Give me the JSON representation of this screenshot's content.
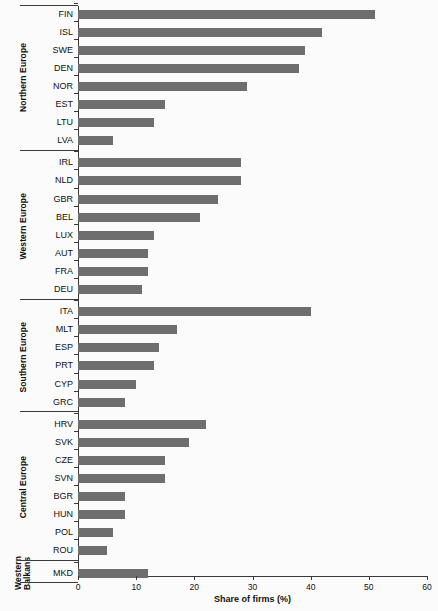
{
  "chart_data": {
    "type": "bar",
    "orientation": "horizontal",
    "title": "",
    "xlabel": "Share of firms (%)",
    "ylabel": "",
    "xlim": [
      0,
      60
    ],
    "xticks": [
      0,
      10,
      20,
      30,
      40,
      50,
      60
    ],
    "grid": false,
    "legend": null,
    "bar_color": "#6e6e6e",
    "categories": [
      "FIN",
      "ISL",
      "SWE",
      "DEN",
      "NOR",
      "EST",
      "LTU",
      "LVA",
      "IRL",
      "NLD",
      "GBR",
      "BEL",
      "LUX",
      "AUT",
      "FRA",
      "DEU",
      "ITA",
      "MLT",
      "ESP",
      "PRT",
      "CYP",
      "GRC",
      "HRV",
      "SVK",
      "CZE",
      "SVN",
      "BGR",
      "HUN",
      "POL",
      "ROU",
      "MKD"
    ],
    "values": [
      51,
      42,
      39,
      38,
      29,
      15,
      13,
      6,
      28,
      28,
      24,
      21,
      13,
      12,
      12,
      11,
      40,
      17,
      14,
      13,
      10,
      8,
      22,
      19,
      15,
      15,
      8,
      8,
      6,
      5,
      12
    ],
    "groups": [
      {
        "label": "Northern Europe",
        "categories": [
          "FIN",
          "ISL",
          "SWE",
          "DEN",
          "NOR",
          "EST",
          "LTU",
          "LVA"
        ],
        "values": [
          51,
          42,
          39,
          38,
          29,
          15,
          13,
          6
        ]
      },
      {
        "label": "Western Europe",
        "categories": [
          "IRL",
          "NLD",
          "GBR",
          "BEL",
          "LUX",
          "AUT",
          "FRA",
          "DEU"
        ],
        "values": [
          28,
          28,
          24,
          21,
          13,
          12,
          12,
          11
        ]
      },
      {
        "label": "Southern Europe",
        "categories": [
          "ITA",
          "MLT",
          "ESP",
          "PRT",
          "CYP",
          "GRC"
        ],
        "values": [
          40,
          17,
          14,
          13,
          10,
          8
        ]
      },
      {
        "label": "Central Europe",
        "categories": [
          "HRV",
          "SVK",
          "CZE",
          "SVN",
          "BGR",
          "HUN",
          "POL",
          "ROU"
        ],
        "values": [
          22,
          19,
          15,
          15,
          8,
          8,
          6,
          5
        ]
      },
      {
        "label": "Western\nBalkans",
        "categories": [
          "MKD"
        ],
        "values": [
          12
        ]
      }
    ]
  }
}
